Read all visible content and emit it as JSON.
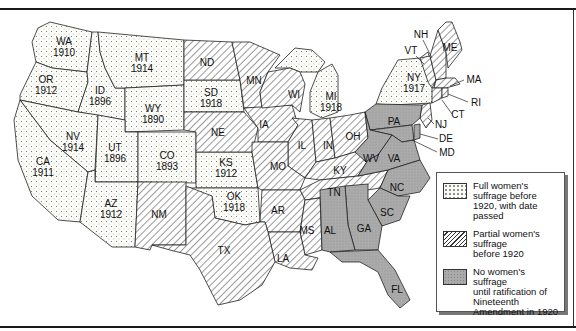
{
  "map": {
    "title_fragment": "",
    "legend": {
      "items": [
        {
          "key": "full",
          "label": "Full women's\nsuffrage before\n1920, with date\npassed"
        },
        {
          "key": "partial",
          "label": "Partial women's\nsuffrage\nbefore 1920"
        },
        {
          "key": "none",
          "label": "No women's suffrage\nuntil ratification of\nNineteenth\nAmendment in 1920"
        }
      ]
    },
    "states": {
      "WA": {
        "abbr": "WA",
        "year": "1910",
        "status": "full"
      },
      "OR": {
        "abbr": "OR",
        "year": "1912",
        "status": "full"
      },
      "ID": {
        "abbr": "ID",
        "year": "1896",
        "status": "full"
      },
      "MT": {
        "abbr": "MT",
        "year": "1914",
        "status": "full"
      },
      "WY": {
        "abbr": "WY",
        "year": "1890",
        "status": "full"
      },
      "NV": {
        "abbr": "NV",
        "year": "1914",
        "status": "full"
      },
      "CA": {
        "abbr": "CA",
        "year": "1911",
        "status": "full"
      },
      "UT": {
        "abbr": "UT",
        "year": "1896",
        "status": "full"
      },
      "CO": {
        "abbr": "CO",
        "year": "1893",
        "status": "full"
      },
      "AZ": {
        "abbr": "AZ",
        "year": "1912",
        "status": "full"
      },
      "SD": {
        "abbr": "SD",
        "year": "1918",
        "status": "full"
      },
      "KS": {
        "abbr": "KS",
        "year": "1912",
        "status": "full"
      },
      "OK": {
        "abbr": "OK",
        "year": "1918",
        "status": "full"
      },
      "MI": {
        "abbr": "MI",
        "year": "1918",
        "status": "full"
      },
      "NY": {
        "abbr": "NY",
        "year": "1917",
        "status": "full"
      },
      "ND": {
        "abbr": "ND",
        "status": "partial"
      },
      "MN": {
        "abbr": "MN",
        "status": "partial"
      },
      "NE": {
        "abbr": "NE",
        "status": "partial"
      },
      "IA": {
        "abbr": "IA",
        "status": "partial"
      },
      "WI": {
        "abbr": "WI",
        "status": "partial"
      },
      "IL": {
        "abbr": "IL",
        "status": "partial"
      },
      "IN": {
        "abbr": "IN",
        "status": "partial"
      },
      "OH": {
        "abbr": "OH",
        "status": "partial"
      },
      "MO": {
        "abbr": "MO",
        "status": "partial"
      },
      "KY": {
        "abbr": "KY",
        "status": "partial"
      },
      "TN": {
        "abbr": "TN",
        "status": "partial"
      },
      "AR": {
        "abbr": "AR",
        "status": "partial"
      },
      "MS": {
        "abbr": "MS",
        "status": "partial"
      },
      "LA": {
        "abbr": "LA",
        "status": "partial"
      },
      "TX": {
        "abbr": "TX",
        "status": "partial"
      },
      "NM": {
        "abbr": "NM",
        "status": "partial"
      },
      "ME": {
        "abbr": "ME",
        "status": "partial"
      },
      "NH": {
        "abbr": "NH",
        "status": "partial"
      },
      "VT": {
        "abbr": "VT",
        "status": "partial"
      },
      "MA": {
        "abbr": "MA",
        "status": "partial"
      },
      "RI": {
        "abbr": "RI",
        "status": "partial"
      },
      "CT": {
        "abbr": "CT",
        "status": "partial"
      },
      "NJ": {
        "abbr": "NJ",
        "status": "partial"
      },
      "DE": {
        "abbr": "DE",
        "status": "none"
      },
      "MD": {
        "abbr": "MD",
        "status": "none"
      },
      "PA": {
        "abbr": "PA",
        "status": "none"
      },
      "WV": {
        "abbr": "WV",
        "status": "none"
      },
      "VA": {
        "abbr": "VA",
        "status": "none"
      },
      "NC": {
        "abbr": "NC",
        "status": "none"
      },
      "SC": {
        "abbr": "SC",
        "status": "none"
      },
      "GA": {
        "abbr": "GA",
        "status": "none"
      },
      "AL": {
        "abbr": "AL",
        "status": "none"
      },
      "FL": {
        "abbr": "FL",
        "status": "none"
      }
    }
  }
}
